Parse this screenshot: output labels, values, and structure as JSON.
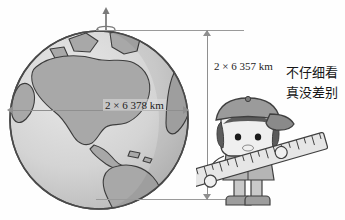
{
  "figure": {
    "title_fragment": "",
    "dimensions": {
      "vertical_label": "2 × 6 357 km",
      "horizontal_label": "2 × 6 378 km"
    },
    "caption": {
      "line1": "不仔细看",
      "line2": "真没差别"
    },
    "icons": {
      "globe": "globe-icon",
      "rotation_axis": "rotation-axis-arrow-icon",
      "boy": "boy-character-icon",
      "ruler": "ruler-icon",
      "cap": "baseball-cap-icon",
      "dim_arrow_up": "arrow-up-icon",
      "dim_arrow_down": "arrow-down-icon",
      "dim_arrow_left": "arrow-left-icon",
      "dim_arrow_right": "arrow-right-icon"
    },
    "colors": {
      "ocean": "#d2d2d2",
      "land": "#a8a8a8",
      "outline": "#4a4a4a",
      "dimension_line": "#8f8f8f",
      "text": "#1d1d1d",
      "ruler_body": "#e6e6e6",
      "cap": "#9b9b9b",
      "skin": "#efefef",
      "shoes": "#9d9d9d"
    }
  }
}
